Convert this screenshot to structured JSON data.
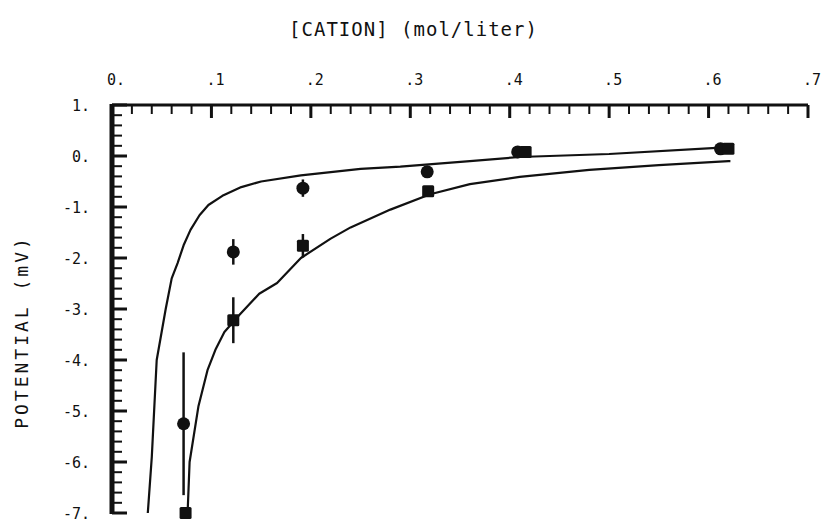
{
  "chart_data": {
    "type": "scatter",
    "title": "[CATION] (mol/liter)",
    "xlabel": "[CATION] (mol/liter)",
    "ylabel": "POTENTIAL (mV)",
    "xlim": [
      0,
      0.7
    ],
    "ylim": [
      -7,
      1
    ],
    "x_axis_position": "top",
    "x_ticks": [
      0,
      0.1,
      0.2,
      0.3,
      0.4,
      0.5,
      0.6,
      0.7
    ],
    "x_tick_labels": [
      "0.",
      ".1",
      ".2",
      ".3",
      ".4",
      ".5",
      ".6",
      ".7"
    ],
    "x_minor_step": 0.02,
    "y_ticks": [
      1,
      0,
      -1,
      -2,
      -3,
      -4,
      -5,
      -6,
      -7
    ],
    "y_tick_labels": [
      "1.",
      "0.",
      "-1.",
      "-2.",
      "-3.",
      "-4.",
      "-5.",
      "-6.",
      "-7."
    ],
    "y_minor_step": 0.2,
    "grid": false,
    "legend": null,
    "series": [
      {
        "name": "circles",
        "marker": "circle",
        "points": [
          {
            "x": 0.072,
            "y": -5.25,
            "err": 1.4
          },
          {
            "x": 0.122,
            "y": -1.88,
            "err": 0.25
          },
          {
            "x": 0.192,
            "y": -0.63,
            "err": 0.17
          },
          {
            "x": 0.317,
            "y": -0.31,
            "err": 0
          },
          {
            "x": 0.408,
            "y": 0.08,
            "err": 0
          },
          {
            "x": 0.612,
            "y": 0.14,
            "err": 0
          }
        ]
      },
      {
        "name": "squares",
        "marker": "square",
        "points": [
          {
            "x": 0.074,
            "y": -7.0,
            "err": 0
          },
          {
            "x": 0.122,
            "y": -3.22,
            "err": 0.45
          },
          {
            "x": 0.192,
            "y": -1.76,
            "err": 0.23
          },
          {
            "x": 0.318,
            "y": -0.69,
            "err": 0
          },
          {
            "x": 0.416,
            "y": 0.08,
            "err": 0
          },
          {
            "x": 0.62,
            "y": 0.14,
            "err": 0
          }
        ]
      }
    ],
    "fit_curves": [
      {
        "name": "upper-fit",
        "points": [
          [
            0.036,
            -7.0
          ],
          [
            0.04,
            -5.9
          ],
          [
            0.045,
            -4.0
          ],
          [
            0.054,
            -3.0
          ],
          [
            0.06,
            -2.4
          ],
          [
            0.066,
            -2.1
          ],
          [
            0.072,
            -1.75
          ],
          [
            0.079,
            -1.45
          ],
          [
            0.088,
            -1.16
          ],
          [
            0.097,
            -0.96
          ],
          [
            0.111,
            -0.78
          ],
          [
            0.13,
            -0.61
          ],
          [
            0.15,
            -0.5
          ],
          [
            0.19,
            -0.38
          ],
          [
            0.25,
            -0.25
          ],
          [
            0.29,
            -0.21
          ],
          [
            0.36,
            -0.1
          ],
          [
            0.41,
            -0.02
          ],
          [
            0.5,
            0.04
          ],
          [
            0.608,
            0.16
          ]
        ]
      },
      {
        "name": "lower-fit",
        "points": [
          [
            0.076,
            -7.0
          ],
          [
            0.078,
            -6.0
          ],
          [
            0.087,
            -4.9
          ],
          [
            0.096,
            -4.2
          ],
          [
            0.104,
            -3.8
          ],
          [
            0.113,
            -3.45
          ],
          [
            0.128,
            -3.12
          ],
          [
            0.148,
            -2.7
          ],
          [
            0.166,
            -2.49
          ],
          [
            0.19,
            -2.0
          ],
          [
            0.22,
            -1.62
          ],
          [
            0.24,
            -1.4
          ],
          [
            0.28,
            -1.05
          ],
          [
            0.32,
            -0.75
          ],
          [
            0.36,
            -0.55
          ],
          [
            0.41,
            -0.41
          ],
          [
            0.48,
            -0.27
          ],
          [
            0.55,
            -0.18
          ],
          [
            0.62,
            -0.1
          ],
          [
            0.622,
            -0.1
          ]
        ]
      }
    ]
  }
}
